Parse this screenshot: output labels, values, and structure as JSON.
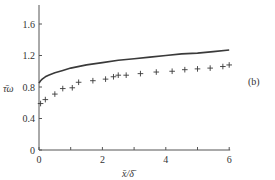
{
  "chart_data": {
    "type": "line",
    "title": "",
    "panel_label": "(b)",
    "xlabel": "x̄/δ̄",
    "ylabel": "τ̄ω",
    "xlim": [
      0,
      6
    ],
    "ylim": [
      0,
      1.8
    ],
    "xticks": [
      0,
      2,
      4,
      6
    ],
    "xtick_labels": [
      "0",
      "2",
      "4",
      "6"
    ],
    "yticks": [
      0,
      0.4,
      0.8,
      1.2,
      1.6
    ],
    "ytick_labels": [
      "0",
      "0.4",
      "0.8",
      "1.2",
      "1.6"
    ],
    "grid": false,
    "legend": null,
    "series": [
      {
        "name": "theory (solid line)",
        "style": "line",
        "x": [
          0.0,
          0.05,
          0.1,
          0.2,
          0.3,
          0.5,
          0.75,
          1.0,
          1.5,
          2.0,
          2.5,
          3.0,
          3.5,
          4.0,
          4.5,
          5.0,
          5.5,
          6.0
        ],
        "y": [
          0.85,
          0.88,
          0.9,
          0.93,
          0.95,
          0.98,
          1.01,
          1.04,
          1.08,
          1.11,
          1.14,
          1.16,
          1.18,
          1.2,
          1.22,
          1.23,
          1.25,
          1.27
        ]
      },
      {
        "name": "data (+ markers)",
        "style": "marker-plus",
        "x": [
          0.05,
          0.2,
          0.5,
          0.75,
          1.05,
          1.25,
          1.7,
          2.1,
          2.35,
          2.5,
          2.75,
          3.2,
          3.7,
          4.2,
          4.6,
          5.0,
          5.4,
          5.8,
          6.0
        ],
        "y": [
          0.59,
          0.64,
          0.71,
          0.78,
          0.79,
          0.86,
          0.88,
          0.9,
          0.93,
          0.95,
          0.95,
          0.97,
          0.99,
          1.0,
          1.02,
          1.03,
          1.04,
          1.06,
          1.08
        ]
      }
    ]
  }
}
